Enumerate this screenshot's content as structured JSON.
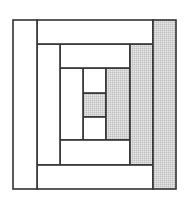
{
  "diagram": {
    "type": "quilt-block",
    "pattern": "log-cabin",
    "colors": {
      "background": "#ffffff",
      "light_fabric": "#ffffff",
      "dark_fabric": "#d2d2d2",
      "stroke": "#333333"
    },
    "pieces": [
      {
        "id": "center",
        "x": 83,
        "y": 93,
        "w": 23,
        "h": 24,
        "shade": "dark"
      },
      {
        "id": "ring1-top",
        "x": 83,
        "y": 68,
        "w": 23,
        "h": 25,
        "shade": "light"
      },
      {
        "id": "ring1-bottom",
        "x": 83,
        "y": 117,
        "w": 23,
        "h": 23,
        "shade": "light"
      },
      {
        "id": "ring1-left",
        "x": 60,
        "y": 68,
        "w": 23,
        "h": 72,
        "shade": "light"
      },
      {
        "id": "ring1-right",
        "x": 106,
        "y": 68,
        "w": 24,
        "h": 72,
        "shade": "dark"
      },
      {
        "id": "ring2-top",
        "x": 60,
        "y": 44,
        "w": 70,
        "h": 24,
        "shade": "light"
      },
      {
        "id": "ring2-bottom",
        "x": 60,
        "y": 140,
        "w": 70,
        "h": 25,
        "shade": "light"
      },
      {
        "id": "ring2-left",
        "x": 37,
        "y": 44,
        "w": 23,
        "h": 121,
        "shade": "light"
      },
      {
        "id": "ring2-right",
        "x": 130,
        "y": 44,
        "w": 23,
        "h": 121,
        "shade": "dark"
      },
      {
        "id": "ring3-top",
        "x": 37,
        "y": 20,
        "w": 116,
        "h": 24,
        "shade": "light"
      },
      {
        "id": "ring3-bottom",
        "x": 37,
        "y": 165,
        "w": 116,
        "h": 24,
        "shade": "light"
      },
      {
        "id": "ring3-left",
        "x": 13,
        "y": 20,
        "w": 24,
        "h": 169,
        "shade": "light"
      },
      {
        "id": "ring3-right",
        "x": 153,
        "y": 20,
        "w": 23,
        "h": 169,
        "shade": "dark"
      }
    ]
  }
}
